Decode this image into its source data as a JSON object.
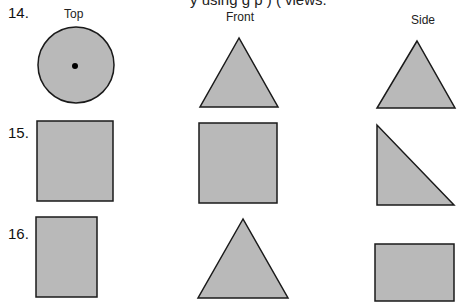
{
  "cropped_header_text": "y using g p ) ( views.",
  "column_headers": {
    "top": "Top",
    "front": "Front",
    "side": "Side"
  },
  "problems": [
    {
      "number": "14.",
      "top": "circle with center dot",
      "front": "triangle",
      "side": "triangle"
    },
    {
      "number": "15.",
      "top": "square",
      "front": "square",
      "side": "right triangle"
    },
    {
      "number": "16.",
      "top": "rectangle",
      "front": "triangle",
      "side": "rectangle"
    }
  ],
  "colors": {
    "fill": "#b9b9b9",
    "stroke": "#1a1a1a",
    "dot": "#000000"
  }
}
